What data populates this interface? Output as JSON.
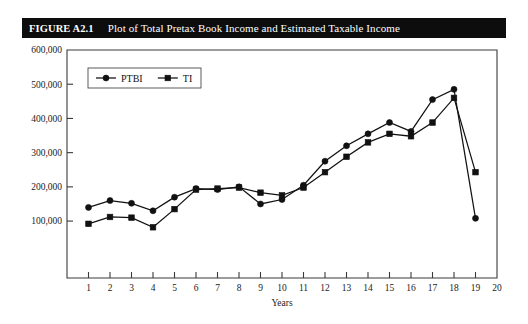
{
  "figure": {
    "label": "FIGURE A2.1",
    "title": "Plot of Total Pretax Book Income and Estimated Taxable Income"
  },
  "chart_data": {
    "type": "line",
    "title": "Plot of Total Pretax Book Income and Estimated Taxable Income",
    "xlabel": "Years",
    "ylabel": "",
    "xlim": [
      0,
      20
    ],
    "ylim": [
      0,
      600000
    ],
    "grid": false,
    "legend_position": "top-left",
    "x_tick_labels": [
      "1",
      "2",
      "3",
      "4",
      "5",
      "6",
      "7",
      "8",
      "9",
      "10",
      "11",
      "12",
      "13",
      "14",
      "15",
      "16",
      "17",
      "18",
      "19",
      "20"
    ],
    "x_ticks": [
      1,
      2,
      3,
      4,
      5,
      6,
      7,
      8,
      9,
      10,
      11,
      12,
      13,
      14,
      15,
      16,
      17,
      18,
      19,
      20
    ],
    "y_tick_labels": [
      "100,000",
      "200,000",
      "300,000",
      "400,000",
      "500,000",
      "600,000"
    ],
    "y_ticks": [
      100000,
      200000,
      300000,
      400000,
      500000,
      600000
    ],
    "x": [
      1,
      2,
      3,
      4,
      5,
      6,
      7,
      8,
      9,
      10,
      11,
      12,
      13,
      14,
      15,
      16,
      17,
      18,
      19
    ],
    "series": [
      {
        "name": "PTBI",
        "marker": "circle",
        "color": "#111111",
        "values": [
          140000,
          160000,
          152000,
          130000,
          170000,
          195000,
          192000,
          200000,
          150000,
          163000,
          205000,
          275000,
          320000,
          355000,
          388000,
          362000,
          455000,
          485000,
          108000
        ]
      },
      {
        "name": "TI",
        "marker": "square",
        "color": "#111111",
        "values": [
          92000,
          112000,
          110000,
          82000,
          135000,
          192000,
          195000,
          198000,
          183000,
          175000,
          198000,
          243000,
          288000,
          330000,
          355000,
          348000,
          388000,
          460000,
          243000
        ]
      }
    ]
  }
}
